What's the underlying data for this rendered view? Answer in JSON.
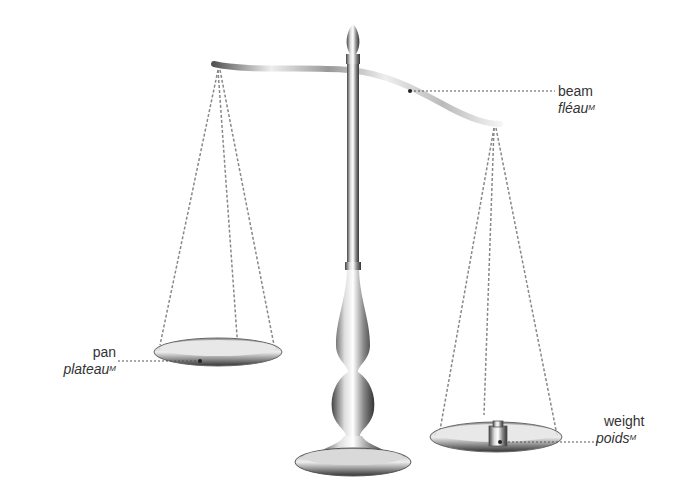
{
  "labels": {
    "beam": {
      "en": "beam",
      "fr": "fléau",
      "gender": "M"
    },
    "pan": {
      "en": "pan",
      "fr": "plateau",
      "gender": "M"
    },
    "weight": {
      "en": "weight",
      "fr": "poids",
      "gender": "M"
    }
  },
  "colors": {
    "leader": "#555555",
    "text": "#333333",
    "metal": "#b8b8b8"
  }
}
